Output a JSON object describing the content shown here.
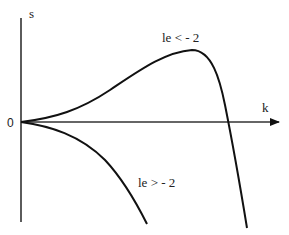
{
  "diagram": {
    "axes": {
      "y_label": "s",
      "x_label": "k",
      "origin_label": "0"
    },
    "curves": [
      {
        "id": "upper",
        "label": "le < - 2",
        "behavior": "rises from origin to a maximum, then falls and crosses the k axis"
      },
      {
        "id": "lower",
        "label": "le > - 2",
        "behavior": "decreases monotonically from origin"
      }
    ],
    "colors": {
      "line": "#111111",
      "background": "#ffffff"
    }
  }
}
